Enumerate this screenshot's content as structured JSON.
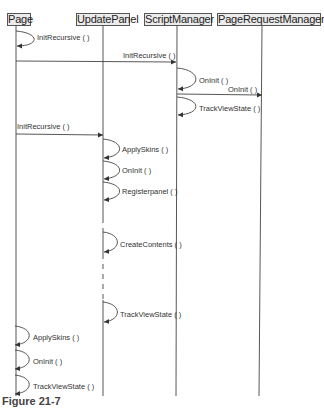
{
  "participants": [
    {
      "name": "Page",
      "x": 16
    },
    {
      "name": "UpdatePanel",
      "x": 103
    },
    {
      "name": "ScriptManager",
      "x": 177
    },
    {
      "name": "PageRequestManager",
      "x": 262
    }
  ],
  "messages": [
    {
      "from": "Page",
      "to": "Page",
      "label": "InitRecursive ( )"
    },
    {
      "from": "Page",
      "to": "ScriptManager",
      "label": "InitRecursive ( )"
    },
    {
      "from": "ScriptManager",
      "to": "ScriptManager",
      "label": "OnInit ( )"
    },
    {
      "from": "ScriptManager",
      "to": "PageRequestManager",
      "label": "OnInit ( )"
    },
    {
      "from": "ScriptManager",
      "to": "ScriptManager",
      "label": "TrackViewState ( )"
    },
    {
      "from": "Page",
      "to": "UpdatePanel",
      "label": "InitRecursive ( )"
    },
    {
      "from": "UpdatePanel",
      "to": "UpdatePanel",
      "label": "ApplySkins ( )"
    },
    {
      "from": "UpdatePanel",
      "to": "UpdatePanel",
      "label": "OnInit ( )"
    },
    {
      "from": "UpdatePanel",
      "to": "UpdatePanel",
      "label": "Registerpanel ( )"
    },
    {
      "from": "UpdatePanel",
      "to": "UpdatePanel",
      "label": "CreateContents ( )"
    },
    {
      "from": "UpdatePanel",
      "to": "UpdatePanel",
      "label": "TrackViewState ( )"
    },
    {
      "from": "Page",
      "to": "Page",
      "label": "ApplySkins ( )"
    },
    {
      "from": "Page",
      "to": "Page",
      "label": "OnInit ( )"
    },
    {
      "from": "Page",
      "to": "Page",
      "label": "TrackViewState ( )"
    }
  ],
  "caption": "Figure 21-7",
  "colors": {
    "line": "#444444",
    "box_fill": "#ececec",
    "box_border": "#555555",
    "text": "#333333"
  }
}
